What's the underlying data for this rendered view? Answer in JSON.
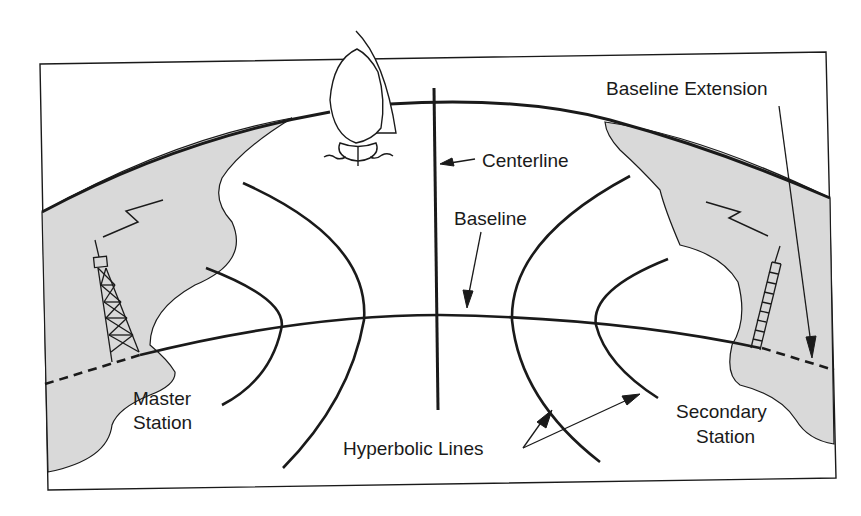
{
  "diagram": {
    "type": "hyperbolic navigation (LORAN) geometry",
    "labels": {
      "baseline_extension": "Baseline Extension",
      "centerline": "Centerline",
      "baseline": "Baseline",
      "master_station_line1": "Master",
      "master_station_line2": "Station",
      "secondary_station_line1": "Secondary",
      "secondary_station_line2": "Station",
      "hyperbolic_lines": "Hyperbolic Lines"
    },
    "elements": [
      "frame",
      "earth-horizon-arc",
      "left-land-mass",
      "right-land-mass",
      "master-station-tower",
      "secondary-station-tower",
      "radio-signal-left",
      "radio-signal-right",
      "sailboat",
      "baseline",
      "baseline-extension-left",
      "baseline-extension-right",
      "centerline",
      "hyperbolic-line-1",
      "hyperbolic-line-2",
      "hyperbolic-line-3",
      "hyperbolic-line-4"
    ],
    "colors": {
      "stroke": "#1a1a1a",
      "land_fill": "#d9d9d9",
      "background": "#ffffff"
    }
  }
}
